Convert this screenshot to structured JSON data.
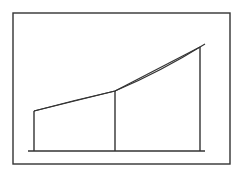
{
  "diagram": {
    "type": "trapezoid-rule-approximation",
    "stroke_color": "#333333",
    "background": "#ffffff",
    "frame": {
      "x": 13,
      "y": 13,
      "width": 217,
      "height": 151
    },
    "baseline": {
      "x1": 28,
      "y1": 151,
      "x2": 205,
      "y2": 151
    },
    "ordinates": [
      {
        "x": 34,
        "y_top": 111,
        "y_base": 151
      },
      {
        "x": 115,
        "y_top": 91,
        "y_base": 151
      },
      {
        "x": 200,
        "y_top": 47,
        "y_base": 151
      }
    ],
    "curve_path": "M34,111 Q75,100 115,91 Q160,72 205,44",
    "chords": [
      {
        "x1": 34,
        "y1": 111,
        "x2": 115,
        "y2": 91
      },
      {
        "x1": 115,
        "y1": 91,
        "x2": 200,
        "y2": 47
      }
    ]
  }
}
